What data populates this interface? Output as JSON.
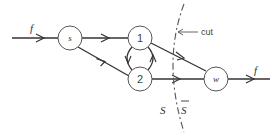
{
  "diagram": {
    "nodes": [
      {
        "id": "s",
        "label": "s",
        "x": 70,
        "y": 38
      },
      {
        "id": "1",
        "label": "1",
        "x": 140,
        "y": 38
      },
      {
        "id": "2",
        "label": "2",
        "x": 140,
        "y": 79
      },
      {
        "id": "w",
        "label": "w",
        "x": 216,
        "y": 79
      }
    ],
    "edges": [
      {
        "from": "in",
        "to": "s",
        "label": "f"
      },
      {
        "from": "s",
        "to": "1"
      },
      {
        "from": "s",
        "to": "2"
      },
      {
        "from": "1",
        "to": "2"
      },
      {
        "from": "2",
        "to": "1"
      },
      {
        "from": "1",
        "to": "w"
      },
      {
        "from": "2",
        "to": "w"
      },
      {
        "from": "w",
        "to": "out",
        "label": "f"
      }
    ],
    "labels": {
      "flow_in": "f",
      "flow_out": "f",
      "cut": "cut",
      "set_s": "S",
      "set_s_bar": "S"
    }
  }
}
